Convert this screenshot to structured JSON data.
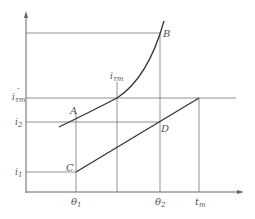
{
  "diagram": {
    "points": {
      "A": "A",
      "B": "B",
      "C": "C",
      "D": "D"
    },
    "y_labels": {
      "itm_dd": "i",
      "itm_dd_sub": "τm",
      "itm_dd_sup": "″",
      "i2": "i",
      "i2_sub": "2",
      "i1": "i",
      "i1_sub": "1"
    },
    "x_labels": {
      "theta1": "θ",
      "theta1_sub": "1",
      "theta2": "θ",
      "theta2_sub": "2",
      "tm": "t",
      "tm_sub": "m"
    },
    "curve_label": {
      "text": "i",
      "sub": "τm"
    },
    "colors": {
      "line": "#555555",
      "curve": "#333333"
    }
  }
}
